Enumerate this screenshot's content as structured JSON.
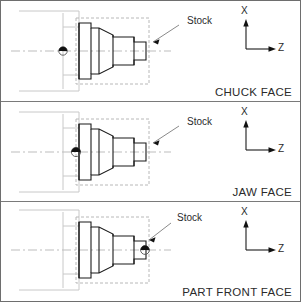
{
  "diagram": {
    "colors": {
      "outline": "#1a1a1a",
      "stock_outline": "#b8b8b8",
      "chuck_outline": "#c8c8c8",
      "centerline": "#bdbdbd",
      "frame": "#6e6e6e",
      "text": "#2b2b2b"
    },
    "axis": {
      "x_label": "X",
      "z_label": "Z",
      "x_icon": "arrow-up-icon",
      "z_icon": "arrow-right-icon"
    },
    "stock_label": "Stock",
    "origin_marker_icon": "datum-origin-icon",
    "panels": [
      {
        "id": "chuck-face",
        "caption": "CHUCK FACE",
        "origin_x": 62,
        "origin_y": 50,
        "origin_style": "triangle",
        "stock_label": "Stock",
        "stock_label_x": 186,
        "stock_label_y": 14,
        "leader_from_x": 178,
        "leader_from_y": 24,
        "leader_to_x": 152,
        "leader_to_y": 41,
        "axis_origin_x": 245,
        "axis_origin_y": 48
      },
      {
        "id": "jaw-face",
        "caption": "JAW FACE",
        "origin_x": 75,
        "origin_y": 50,
        "origin_style": "circle",
        "stock_label": "Stock",
        "stock_label_x": 186,
        "stock_label_y": 14,
        "leader_from_x": 178,
        "leader_from_y": 24,
        "leader_to_x": 152,
        "leader_to_y": 41,
        "axis_origin_x": 245,
        "axis_origin_y": 48
      },
      {
        "id": "part-front-face",
        "caption": "PART FRONT FACE",
        "origin_x": 144,
        "origin_y": 50,
        "origin_style": "circle",
        "stock_label": "Stock",
        "stock_label_x": 176,
        "stock_label_y": 10,
        "leader_from_x": 170,
        "leader_from_y": 21,
        "leader_to_x": 148,
        "leader_to_y": 38,
        "axis_origin_x": 245,
        "axis_origin_y": 48
      }
    ],
    "part_profile": {
      "description": "stepped turned part, half-profile mirrored about centerline",
      "centerline_y": 50,
      "points": [
        [
          78,
          22
        ],
        [
          90,
          22
        ],
        [
          90,
          27
        ],
        [
          98,
          27
        ],
        [
          112,
          34
        ],
        [
          112,
          36
        ],
        [
          133,
          36
        ],
        [
          133,
          41
        ],
        [
          145,
          41
        ],
        [
          145,
          50
        ]
      ]
    },
    "stock_box": {
      "x": 75,
      "y": 17,
      "width": 73,
      "height": 66
    },
    "chuck_body": {
      "x": 18,
      "y": 10,
      "width": 60,
      "height": 80
    }
  }
}
